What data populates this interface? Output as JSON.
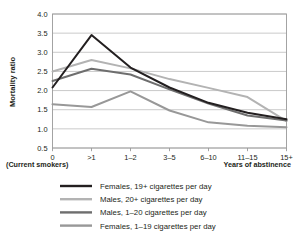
{
  "chart_data": {
    "type": "line",
    "title": "",
    "subtitle": "",
    "xlabel": "Years of abstinence",
    "xlabel_left": "(Current smokers)",
    "ylabel": "Mortality ratio",
    "categories": [
      "0",
      ">1",
      "1–2",
      "3–5",
      "6–10",
      "11–15",
      "15+"
    ],
    "ylim": [
      0.5,
      4.0
    ],
    "yticks": [
      "0.5",
      "1.0",
      "1.5",
      "2.0",
      "2.5",
      "3.0",
      "3.5",
      "4.0"
    ],
    "ytick_values": [
      0.5,
      1.0,
      1.5,
      2.0,
      2.5,
      3.0,
      3.5,
      4.0
    ],
    "grid": true,
    "legend_position": "bottom",
    "series": [
      {
        "name": "Females, 19+ cigarettes per day",
        "color": "#231f20",
        "values": [
          2.08,
          3.45,
          2.6,
          2.08,
          1.68,
          1.42,
          1.25
        ]
      },
      {
        "name": "Males, 20+ cigarettes per day",
        "color": "#b3b3b3",
        "values": [
          2.5,
          2.8,
          2.58,
          2.3,
          2.07,
          1.83,
          1.2
        ]
      },
      {
        "name": "Males, 1–20 cigarettes per day",
        "color": "#6e6e6e",
        "values": [
          2.25,
          2.57,
          2.42,
          2.03,
          1.66,
          1.35,
          1.22
        ]
      },
      {
        "name": "Females, 1–19 cigarettes per day",
        "color": "#989898",
        "values": [
          1.64,
          1.57,
          1.98,
          1.48,
          1.17,
          1.08,
          1.04
        ]
      }
    ]
  },
  "legend": {
    "items": [
      {
        "label": "Females, 19+ cigarettes per day",
        "color": "#231f20"
      },
      {
        "label": "Males, 20+ cigarettes per day",
        "color": "#b3b3b3"
      },
      {
        "label": "Males, 1–20 cigarettes per day",
        "color": "#6e6e6e"
      },
      {
        "label": "Females, 1–19 cigarettes per day",
        "color": "#989898"
      }
    ]
  },
  "axes": {
    "y_title": "Mortality ratio",
    "x_title_right": "Years of abstinence",
    "x_title_left": "(Current smokers)"
  },
  "colors": {
    "grid": "#bdbdbd",
    "frame": "#9a9a9a",
    "text": "#231f20",
    "background": "#ffffff"
  }
}
